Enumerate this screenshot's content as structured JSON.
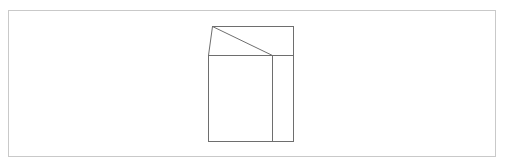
{
  "canvas": {
    "width": 505,
    "height": 167,
    "background_color": "#ffffff",
    "description": "Simple line-art wireframe drawing of a three-dimensional box with an open lid, centered inside a thin rectangular frame"
  },
  "frame": {
    "name": "outer-border-frame",
    "x": 8,
    "y": 10,
    "width": 488,
    "height": 147,
    "stroke_color": "#c9c9c9",
    "stroke_width": 1,
    "fill_color": "#ffffff"
  },
  "figure": {
    "name": "wireframe-box",
    "stroke_color": "#6e6e6e",
    "stroke_width": 1,
    "fill_color": "#ffffff",
    "bounds": {
      "x": 208,
      "y": 26,
      "width": 85,
      "height": 115
    },
    "vertices": {
      "apex_top_left": [
        212,
        26
      ],
      "top_right": [
        293,
        26
      ],
      "mid_right": [
        293,
        55
      ],
      "bottom_right": [
        293,
        141
      ],
      "bottom_left": [
        208,
        141
      ],
      "mid_left": [
        208,
        55
      ],
      "mid_divider_top": [
        272,
        55
      ],
      "mid_divider_bottom": [
        272,
        141
      ]
    },
    "edges": [
      {
        "name": "lid-top-edge",
        "from": [
          212,
          26
        ],
        "to": [
          293,
          26
        ]
      },
      {
        "name": "lid-left-slant-edge",
        "from": [
          212,
          26
        ],
        "to": [
          208,
          55
        ]
      },
      {
        "name": "lid-diagonal-fold-edge",
        "from": [
          212,
          26
        ],
        "to": [
          272,
          55
        ]
      },
      {
        "name": "body-right-edge",
        "from": [
          293,
          26
        ],
        "to": [
          293,
          141
        ]
      },
      {
        "name": "body-bottom-edge",
        "from": [
          208,
          141
        ],
        "to": [
          293,
          141
        ]
      },
      {
        "name": "body-left-edge",
        "from": [
          208,
          55
        ],
        "to": [
          208,
          141
        ]
      },
      {
        "name": "body-top-horizontal-edge",
        "from": [
          208,
          55
        ],
        "to": [
          293,
          55
        ]
      },
      {
        "name": "body-vertical-divider-edge",
        "from": [
          272,
          55
        ],
        "to": [
          272,
          141
        ]
      }
    ],
    "faces": [
      {
        "name": "front-face",
        "points": "208,55 272,55 272,141 208,141"
      },
      {
        "name": "side-face",
        "points": "272,55 293,55 293,141 272,141"
      },
      {
        "name": "lid-face",
        "points": "212,26 293,26 293,55 208,55"
      }
    ]
  }
}
